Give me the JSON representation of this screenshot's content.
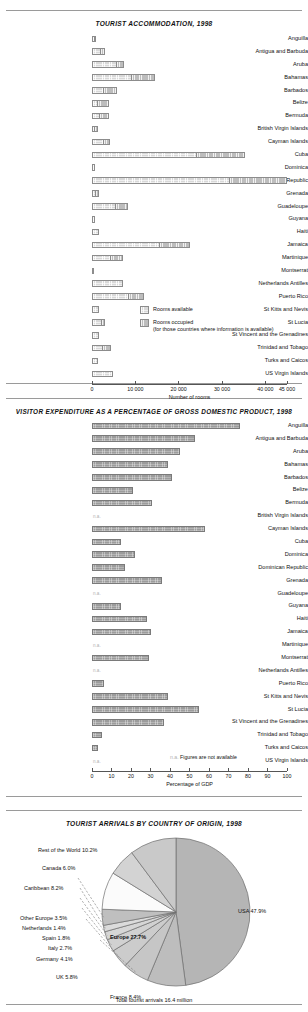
{
  "charts": {
    "accommodation": {
      "title": "TOURIST ACCOMMODATION, 1998",
      "xlabel": "Number of rooms",
      "legend": [
        {
          "key": "available",
          "label": "Rooms available"
        },
        {
          "key": "occupied",
          "label": "Rooms occupied"
        },
        {
          "key": "occupied_note",
          "label": "(for those countries where information is available)"
        }
      ],
      "ticks": [
        "0",
        "10 000",
        "20 000",
        "30 000",
        "40 000",
        "45 000"
      ]
    },
    "expenditure": {
      "title": "VISITOR EXPENDITURE AS A PERCENTAGE OF GROSS DOMESTIC PRODUCT, 1998",
      "xlabel": "Percentage of GDP",
      "na_mark": "n.a.",
      "na_note": "Figures are not available",
      "ticks": [
        "0",
        "10",
        "20",
        "30",
        "40",
        "50",
        "60",
        "70",
        "80",
        "90",
        "100"
      ]
    },
    "arrivals": {
      "title": "TOURIST ARRIVALS BY COUNTRY OF ORIGIN, 1998",
      "total_note": "Total tourist arrivals 16.4 million",
      "europe_label": "Europe 27.7%"
    }
  },
  "chart_data": [
    {
      "type": "bar",
      "orientation": "horizontal",
      "stacked": false,
      "title": "TOURIST ACCOMMODATION, 1998",
      "xlabel": "Number of rooms",
      "ylabel": "",
      "xlim": [
        0,
        45000
      ],
      "xticks": [
        0,
        10000,
        20000,
        30000,
        40000,
        45000
      ],
      "grid": false,
      "legend": [
        "Rooms available",
        "Rooms occupied (for those countries where information is available)"
      ],
      "legend_position": "inside-bottom-right",
      "categories": [
        "Anguilla",
        "Antigua and Barbuda",
        "Aruba",
        "Bahamas",
        "Barbados",
        "Belize",
        "Bermuda",
        "British Virgin Islands",
        "Cayman Islands",
        "Cuba",
        "Dominica",
        "Dominican Republic",
        "Grenada",
        "Guadeloupe",
        "Guyana",
        "Haiti",
        "Jamaica",
        "Martinique",
        "Montserrat",
        "Netherlands Antilles",
        "Puerto Rico",
        "St Kitts and Nevis",
        "St Lucia",
        "St Vincent and the Grenadines",
        "Trinidad and Tobago",
        "Turks and Caicos",
        "US Virgin Islands"
      ],
      "series": [
        {
          "name": "Rooms available",
          "values": [
            900,
            3100,
            7300,
            14500,
            5800,
            3900,
            4000,
            1300,
            4200,
            35200,
            800,
            45000,
            1700,
            8200,
            700,
            1700,
            22700,
            7200,
            200,
            7200,
            12100,
            1600,
            3000,
            1500,
            4300,
            1300,
            4900
          ]
        },
        {
          "name": "Rooms occupied",
          "values": [
            400,
            1900,
            5600,
            9000,
            2500,
            1200,
            1600,
            500,
            2600,
            24000,
            0,
            31700,
            700,
            5300,
            0,
            0,
            15500,
            4100,
            0,
            0,
            8200,
            0,
            2100,
            0,
            2200,
            0,
            0
          ]
        }
      ]
    },
    {
      "type": "bar",
      "orientation": "horizontal",
      "title": "VISITOR EXPENDITURE AS A PERCENTAGE OF GROSS DOMESTIC PRODUCT, 1998",
      "xlabel": "Percentage of GDP",
      "ylabel": "",
      "xlim": [
        0,
        100
      ],
      "xticks": [
        0,
        10,
        20,
        30,
        40,
        50,
        60,
        70,
        80,
        90,
        100
      ],
      "grid": false,
      "na_label": "n.a.",
      "na_note": "Figures are not available",
      "categories": [
        "Anguilla",
        "Antigua and Barbuda",
        "Aruba",
        "Bahamas",
        "Barbados",
        "Belize",
        "Bermuda",
        "British Virgin Islands",
        "Cayman Islands",
        "Cuba",
        "Dominica",
        "Dominican Republic",
        "Grenada",
        "Guadeloupe",
        "Guyana",
        "Haiti",
        "Jamaica",
        "Martinique",
        "Montserrat",
        "Netherlands Antilles",
        "Puerto Rico",
        "St Kitts and Nevis",
        "St Lucia",
        "St Vincent and the Grenadines",
        "Trinidad and Tobago",
        "Turks and Caicos",
        "US Virgin Islands"
      ],
      "values": [
        76,
        53,
        45,
        39,
        41,
        21,
        31,
        null,
        58,
        15,
        22,
        17,
        36,
        null,
        15,
        28,
        30,
        null,
        29,
        null,
        6,
        39,
        55,
        37,
        5,
        3,
        null
      ]
    },
    {
      "type": "pie",
      "title": "TOURIST ARRIVALS BY COUNTRY OF ORIGIN, 1998",
      "total_note": "Total tourist arrivals 16.4 million",
      "group_annotation": "Europe 27.7%",
      "labels": [
        "USA 47.9%",
        "France 8.4%",
        "UK 5.8%",
        "Germany 4.1%",
        "Italy 2.7%",
        "Spain 1.8%",
        "Netherlands 1.4%",
        "Other Europe 3.5%",
        "Caribbean 8.2%",
        "Canada 6.0%",
        "Rest of the World 10.2%"
      ],
      "slices": [
        {
          "name": "USA",
          "value": 47.9
        },
        {
          "name": "France",
          "value": 8.4
        },
        {
          "name": "UK",
          "value": 5.8
        },
        {
          "name": "Germany",
          "value": 4.1
        },
        {
          "name": "Italy",
          "value": 2.7
        },
        {
          "name": "Spain",
          "value": 1.8
        },
        {
          "name": "Netherlands",
          "value": 1.4
        },
        {
          "name": "Other Europe",
          "value": 3.5
        },
        {
          "name": "Caribbean",
          "value": 8.2
        },
        {
          "name": "Canada",
          "value": 6.0
        },
        {
          "name": "Rest of the World",
          "value": 10.2
        }
      ]
    }
  ],
  "colors": {
    "rooms_available": "#d8d8d8",
    "rooms_occupied": "#bdbdbd",
    "gdp_bar": "#9c9c9c",
    "axis": "#555555",
    "na_text": "#b0b0b0"
  }
}
